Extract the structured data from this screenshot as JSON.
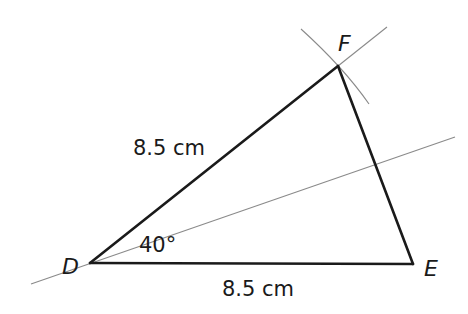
{
  "diagram": {
    "type": "triangle-construction",
    "vertices": [
      {
        "name": "D",
        "x": 90,
        "y": 263
      },
      {
        "name": "E",
        "x": 413,
        "y": 264
      },
      {
        "name": "F",
        "x": 338,
        "y": 66
      }
    ],
    "labels": {
      "vertex_d": "D",
      "vertex_e": "E",
      "vertex_f": "F",
      "side_df": "8.5 cm",
      "side_de": "8.5 cm",
      "angle_d": "40°"
    },
    "construction": {
      "bisector_line": {
        "x1": 31,
        "y1": 284,
        "x2": 455,
        "y2": 137
      },
      "df_extension": {
        "x1": 338,
        "y1": 66,
        "x2": 387,
        "y2": 27
      },
      "compass_arc": "arc centred at E through F"
    },
    "colors": {
      "triangle_stroke": "#1a1a1a",
      "construction_stroke": "#8a8a8a",
      "background": "#ffffff"
    }
  }
}
